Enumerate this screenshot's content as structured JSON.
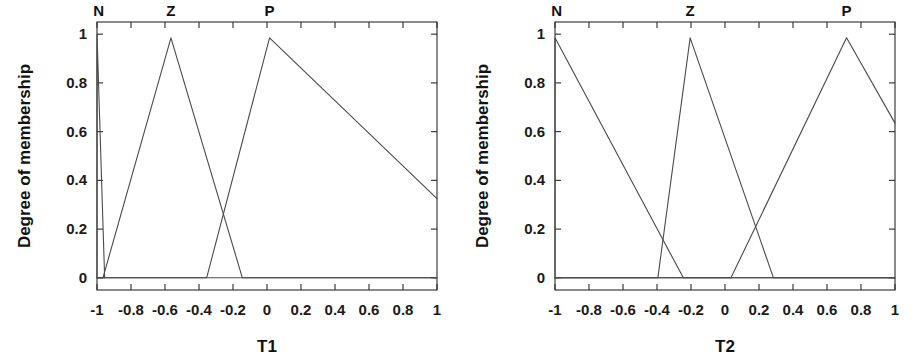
{
  "figure": {
    "background": "#ffffff",
    "line_color": "#4a4a4a",
    "axis_color": "#2b2b2b",
    "text_color": "#111111"
  },
  "chart_data": [
    {
      "type": "line",
      "title": "",
      "xlabel": "T1",
      "ylabel": "Degree of membership",
      "xlim": [
        -1,
        1
      ],
      "ylim": [
        -0.05,
        1.05
      ],
      "grid": false,
      "legend": "none",
      "xticks": [
        -1,
        -0.8,
        -0.6,
        -0.4,
        -0.2,
        0,
        0.2,
        0.4,
        0.6,
        0.8,
        1
      ],
      "xticklabels": [
        "-1",
        "-0.8",
        "-0.6",
        "-0.4",
        "-0.2",
        "0",
        "0.2",
        "0.4",
        "0.6",
        "0.8",
        "1"
      ],
      "yticks": [
        0,
        0.2,
        0.4,
        0.6,
        0.8,
        1
      ],
      "yticklabels": [
        "0",
        "0.2",
        "0.4",
        "0.6",
        "0.8",
        "1"
      ],
      "annotations": [
        {
          "text": "N",
          "x": -0.99,
          "y": 1.06
        },
        {
          "text": "Z",
          "x": -0.565,
          "y": 1.06
        },
        {
          "text": "P",
          "x": 0.015,
          "y": 1.06
        }
      ],
      "series": [
        {
          "name": "N",
          "x": [
            -1,
            -1,
            -0.955
          ],
          "y": [
            0,
            1,
            0
          ]
        },
        {
          "name": "Z",
          "x": [
            -1,
            -0.965,
            -0.565,
            -0.145,
            1
          ],
          "y": [
            0,
            0,
            0.985,
            0,
            0
          ]
        },
        {
          "name": "P",
          "x": [
            -1,
            -0.355,
            0.015,
            1
          ],
          "y": [
            0,
            0,
            0.985,
            0.325
          ]
        }
      ]
    },
    {
      "type": "line",
      "title": "",
      "xlabel": "T2",
      "ylabel": "Degree of membership",
      "xlim": [
        -1,
        1
      ],
      "ylim": [
        -0.05,
        1.05
      ],
      "grid": false,
      "legend": "none",
      "xticks": [
        -1,
        -0.8,
        -0.6,
        -0.4,
        -0.2,
        0,
        0.2,
        0.4,
        0.6,
        0.8,
        1
      ],
      "xticklabels": [
        "-1",
        "-0.8",
        "-0.6",
        "-0.4",
        "-0.2",
        "0",
        "0.2",
        "0.4",
        "0.6",
        "0.8",
        "1"
      ],
      "yticks": [
        0,
        0.2,
        0.4,
        0.6,
        0.8,
        1
      ],
      "yticklabels": [
        "0",
        "0.2",
        "0.4",
        "0.6",
        "0.8",
        "1"
      ],
      "annotations": [
        {
          "text": "N",
          "x": -0.99,
          "y": 1.06
        },
        {
          "text": "Z",
          "x": -0.205,
          "y": 1.06
        },
        {
          "text": "P",
          "x": 0.715,
          "y": 1.06
        }
      ],
      "series": [
        {
          "name": "N",
          "x": [
            -1,
            -1,
            -0.245,
            1
          ],
          "y": [
            0,
            0.985,
            0,
            0
          ]
        },
        {
          "name": "Z",
          "x": [
            -1,
            -0.395,
            -0.205,
            0.285,
            1
          ],
          "y": [
            0,
            0,
            0.985,
            0,
            0
          ]
        },
        {
          "name": "P",
          "x": [
            -1,
            0.035,
            0.715,
            1
          ],
          "y": [
            0,
            0,
            0.985,
            0.635
          ]
        }
      ]
    }
  ]
}
